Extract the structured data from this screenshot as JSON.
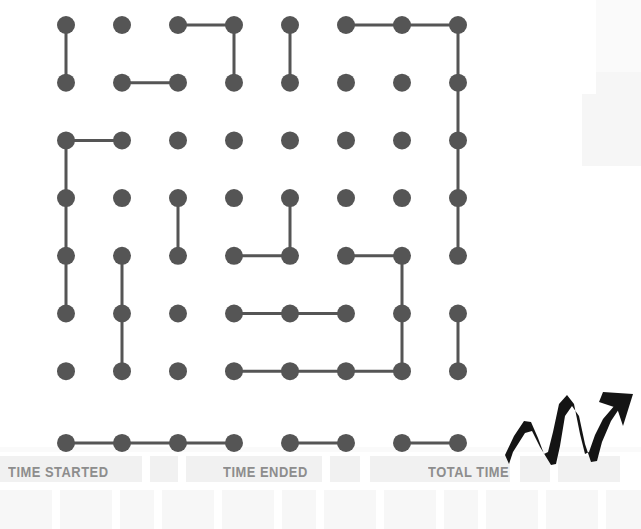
{
  "page": {
    "background_color": "#ffffff"
  },
  "board": {
    "name": "dots-and-boxes-grid",
    "rows": 8,
    "cols": 8,
    "dot_color": "#555555",
    "line_color": "#555555",
    "dot_radius": 9,
    "line_width": 3,
    "origin_x": 66,
    "origin_y": 25,
    "step_x": 56,
    "step_y": 57.7,
    "row8_offset_y": 14,
    "horizontal_edges": [
      [
        1,
        3
      ],
      [
        1,
        6
      ],
      [
        1,
        7
      ],
      [
        2,
        2
      ],
      [
        3,
        1
      ],
      [
        5,
        4
      ],
      [
        5,
        6
      ],
      [
        6,
        4
      ],
      [
        6,
        5
      ],
      [
        7,
        4
      ],
      [
        7,
        5
      ],
      [
        7,
        6
      ],
      [
        8,
        1
      ],
      [
        8,
        2
      ],
      [
        8,
        3
      ],
      [
        8,
        5
      ],
      [
        8,
        7
      ]
    ],
    "vertical_edges": [
      [
        1,
        1
      ],
      [
        3,
        1
      ],
      [
        4,
        1
      ],
      [
        5,
        1
      ],
      [
        5,
        2
      ],
      [
        6,
        2
      ],
      [
        4,
        3
      ],
      [
        1,
        4
      ],
      [
        1,
        5
      ],
      [
        4,
        5
      ],
      [
        5,
        7
      ],
      [
        6,
        7
      ],
      [
        1,
        8
      ],
      [
        2,
        8
      ],
      [
        3,
        8
      ],
      [
        4,
        8
      ],
      [
        6,
        8
      ]
    ]
  },
  "footer": {
    "labels": [
      {
        "id": "time-started",
        "text": "TIME STARTED",
        "x": 8,
        "y": 14
      },
      {
        "id": "time-ended",
        "text": "TIME ENDED",
        "x": 223,
        "y": 14
      },
      {
        "id": "total-time",
        "text": "TOTAL TIME",
        "x": 428,
        "y": 14
      }
    ],
    "slots_upper": [
      {
        "x": 0,
        "y": 6,
        "w": 142,
        "h": 26
      },
      {
        "x": 150,
        "y": 6,
        "w": 28,
        "h": 26
      },
      {
        "x": 186,
        "y": 6,
        "w": 136,
        "h": 26
      },
      {
        "x": 330,
        "y": 6,
        "w": 30,
        "h": 26
      },
      {
        "x": 370,
        "y": 6,
        "w": 140,
        "h": 26
      },
      {
        "x": 520,
        "y": 6,
        "w": 30,
        "h": 26
      },
      {
        "x": 558,
        "y": 6,
        "w": 62,
        "h": 26
      }
    ],
    "slots_lower": [
      {
        "x": 0,
        "y": 40,
        "w": 52,
        "h": 39
      },
      {
        "x": 60,
        "y": 40,
        "w": 52,
        "h": 39
      },
      {
        "x": 120,
        "y": 40,
        "w": 34,
        "h": 39
      },
      {
        "x": 162,
        "y": 40,
        "w": 52,
        "h": 39
      },
      {
        "x": 222,
        "y": 40,
        "w": 52,
        "h": 39
      },
      {
        "x": 282,
        "y": 40,
        "w": 34,
        "h": 39
      },
      {
        "x": 324,
        "y": 40,
        "w": 52,
        "h": 39
      },
      {
        "x": 384,
        "y": 40,
        "w": 52,
        "h": 39
      },
      {
        "x": 444,
        "y": 40,
        "w": 34,
        "h": 39
      },
      {
        "x": 486,
        "y": 40,
        "w": 52,
        "h": 39
      },
      {
        "x": 546,
        "y": 40,
        "w": 52,
        "h": 39
      },
      {
        "x": 606,
        "y": 40,
        "w": 35,
        "h": 39
      }
    ]
  },
  "decorations": {
    "arrow": {
      "name": "upward-zigzag-arrow",
      "color": "#1a1a1a",
      "description": "hand drawn rising zigzag arrow pointing up-right"
    },
    "paper_bands": [
      {
        "x": 596,
        "y": 0,
        "w": 45,
        "h": 72,
        "tone": "softer"
      },
      {
        "x": 596,
        "y": 72,
        "w": 45,
        "h": 22,
        "tone": "soft"
      },
      {
        "x": 582,
        "y": 94,
        "w": 59,
        "h": 72,
        "tone": "soft"
      },
      {
        "x": 0,
        "y": 447,
        "w": 641,
        "h": 5,
        "tone": "softer"
      }
    ]
  }
}
